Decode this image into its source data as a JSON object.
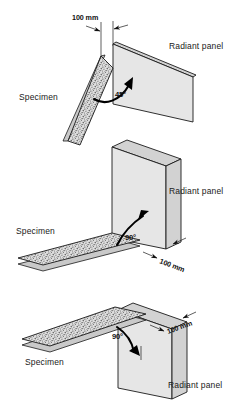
{
  "figure": {
    "type": "technical-diagram",
    "panel_count": 3
  },
  "diagrams": [
    {
      "id": "top",
      "angle_label": "45°",
      "dimension_label": "100 mm",
      "specimen_label": "Specimen",
      "radiant_panel_label": "Radiant panel"
    },
    {
      "id": "middle",
      "angle_label": "90°",
      "dimension_label": "100 mm",
      "specimen_label": "Specimen",
      "radiant_panel_label": "Radiant panel"
    },
    {
      "id": "bottom",
      "angle_label": "90°",
      "dimension_label": "100 mm",
      "specimen_label": "Specimen",
      "radiant_panel_label": "Radiant panel"
    }
  ],
  "colors": {
    "panel_face": "#e6e6e6",
    "panel_edge": "#d2d2d2",
    "specimen_fill": "#d8d8d8",
    "outline": "#1a1a1a",
    "background": "#ffffff"
  }
}
